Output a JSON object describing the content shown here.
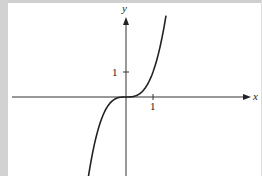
{
  "chart_data": {
    "type": "line",
    "title": "",
    "xlabel": "x",
    "ylabel": "y",
    "function": "y = x^3",
    "x_ticks": [
      {
        "value": 1,
        "label": "1"
      }
    ],
    "y_ticks": [
      {
        "value": 1,
        "label": "1"
      }
    ],
    "xlim": [
      -4.2,
      4.4
    ],
    "ylim": [
      -3.1,
      3.2
    ],
    "grid": false,
    "legend": null,
    "series": [
      {
        "name": "curve",
        "x": [
          -1.37,
          -1.0,
          -0.5,
          0,
          0.5,
          1.0,
          1.44
        ],
        "values": [
          -2.57,
          -1.0,
          -0.125,
          0,
          0.125,
          1.0,
          2.99
        ]
      }
    ]
  },
  "labels": {
    "x_axis": "x",
    "y_axis": "y",
    "x_tick_1": "1",
    "y_tick_1": "1"
  },
  "colors": {
    "axis": "#333333",
    "curve": "#222222",
    "frame": "#d0d0d0"
  }
}
